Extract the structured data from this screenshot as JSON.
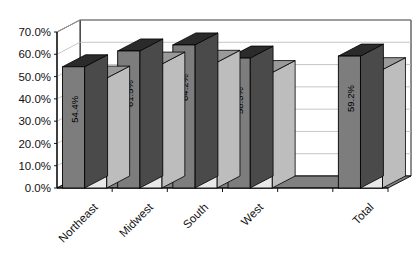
{
  "chart_data": {
    "type": "bar",
    "title": "",
    "subtitle": "",
    "xlabel": "",
    "ylabel": "",
    "ylim": [
      0,
      0.7
    ],
    "ytick_labels": [
      "0.0%",
      "10.0%",
      "20.0%",
      "30.0%",
      "40.0%",
      "50.0%",
      "60.0%",
      "70.0%"
    ],
    "ytick_values": [
      0,
      10,
      20,
      30,
      40,
      50,
      60,
      70
    ],
    "grid": true,
    "legend": "none",
    "three_d": true,
    "categories": [
      "Northeast",
      "Midwest",
      "South",
      "West",
      "",
      "Total"
    ],
    "series": [
      {
        "name": "series-1",
        "color": "#7d7d7d",
        "values": [
          54.4,
          61.5,
          64.2,
          58.3,
          null,
          59.2
        ],
        "labels": [
          "54.4%",
          "61.5%",
          "64.2%",
          "58.3%",
          "",
          "59.2%"
        ]
      },
      {
        "name": "series-2",
        "color": "#e4e4e4",
        "values": [
          49.3,
          55.6,
          56.4,
          51.8,
          null,
          53.1
        ],
        "labels": [
          "49.3%",
          "55.6%",
          "56.4%",
          "51.8%",
          "",
          "53.1%"
        ]
      }
    ]
  },
  "colors": {
    "plot_background": "#ffffff",
    "floor": "#808080",
    "gridline": "#b8b8b8",
    "axis": "#000000",
    "series1_front": "#7d7d7d",
    "series1_top": "#2b2b2b",
    "series1_side": "#4a4a4a",
    "series2_front": "#e8e8e8",
    "series2_top": "#9a9a9a",
    "series2_side": "#bdbdbd",
    "text": "#111111"
  }
}
